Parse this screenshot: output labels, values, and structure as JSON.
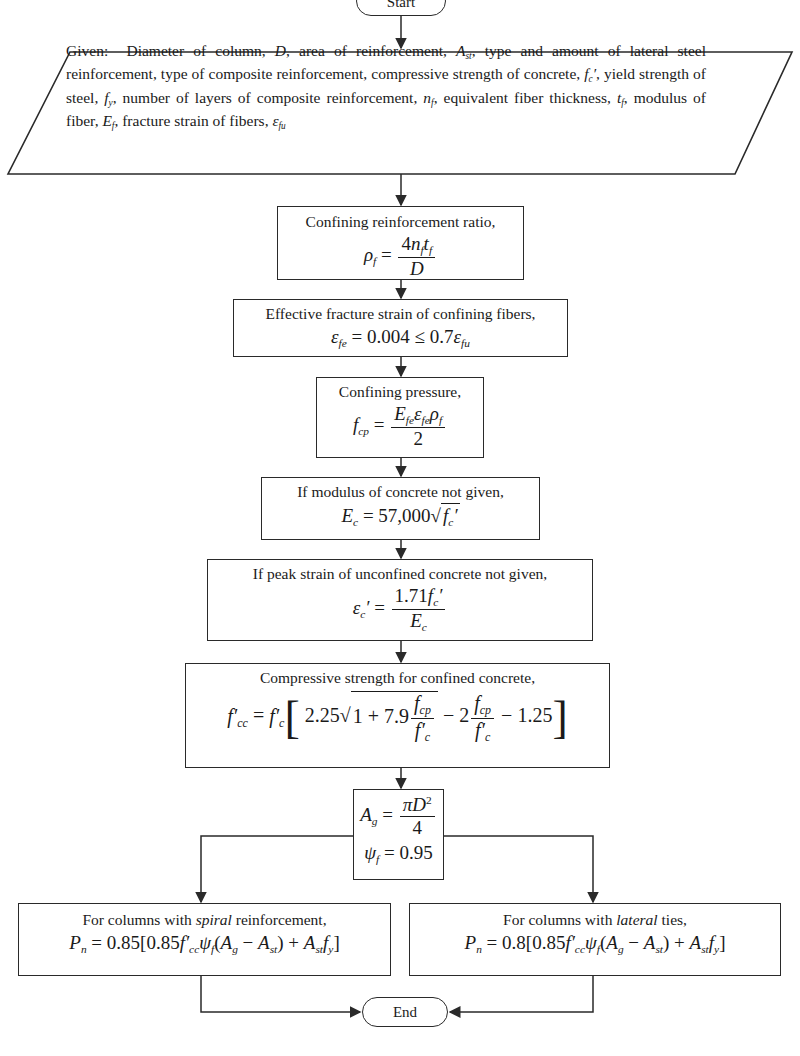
{
  "flowchart": {
    "start": {
      "label": "Start"
    },
    "given": {
      "text": "Given:  Diameter of column, D, area of reinforcement, Ast, type and amount of lateral steel reinforcement, type of composite reinforcement, compressive strength of concrete, fc′, yield strength of steel, fy, number of layers of composite reinforcement, nf, equivalent fiber thickness, tf, modulus of fiber, Ef, fracture strain of fibers, εfu"
    },
    "steps": [
      {
        "label": "Confining reinforcement ratio,",
        "equation": "ρf = 4 nf tf / D"
      },
      {
        "label": "Effective fracture strain of confining fibers,",
        "equation": "εfe = 0.004 ≤ 0.7 εfu"
      },
      {
        "label": "Confining pressure,",
        "equation": "fcp = Efe εfe ρf / 2"
      },
      {
        "label": "If modulus of concrete not given,",
        "equation": "Ec = 57,000 √fc′"
      },
      {
        "label": "If peak strain of unconfined concrete not given,",
        "equation": "εc′ = 1.71 fc′ / Ec"
      },
      {
        "label": "Compressive strength for confined concrete,",
        "equation": "f′cc = f′c [2.25 √(1 + 7.9 fcp/f′c) − 2 fcp/f′c − 1.25]"
      },
      {
        "label": "",
        "equation": "Ag = πD²/4 ; ψf = 0.95"
      }
    ],
    "branches": [
      {
        "label_pre": "For columns with ",
        "label_em": "spiral",
        "label_post": " reinforcement,",
        "equation": "Pn = 0.85[0.85 f′cc ψf (Ag − Ast) + Ast fy]"
      },
      {
        "label_pre": "For columns with ",
        "label_em": "lateral",
        "label_post": " ties,",
        "equation": "Pn = 0.8[0.85 f′cc ψf (Ag − Ast) + Ast fy]"
      }
    ],
    "end": {
      "label": "End"
    }
  },
  "eqparts": {
    "n085": "0.85",
    "n08": "0.8",
    "n0004": "0.004",
    "n07": "0.7",
    "n57000": "57,000",
    "n171": "1.71",
    "n225": "2.25",
    "n79": "7.9",
    "n125": "1.25",
    "n095": "0.95",
    "two": "2",
    "four": "4"
  }
}
